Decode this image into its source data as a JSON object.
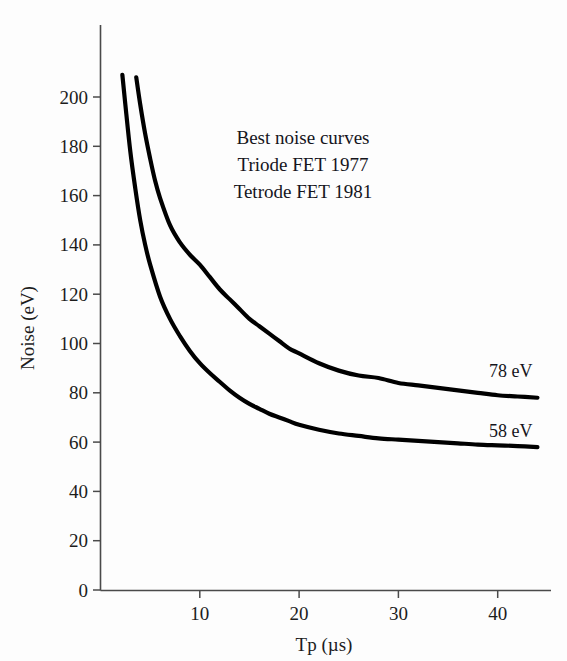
{
  "figure": {
    "background_color": "#fdfdfd",
    "curve_color": "#000000",
    "axis_color": "#4a4a4a",
    "text_color": "#15151c"
  },
  "annotations": {
    "line1": "Best noise curves",
    "line2": "Triode FET 1977",
    "line3": "Tetrode FET 1981"
  },
  "curve_labels": {
    "upper": "78 eV",
    "lower": "58 eV"
  },
  "axis_titles": {
    "x": "Tp (µs)",
    "y": "Noise (eV)"
  },
  "x_ticks": [
    "10",
    "20",
    "30",
    "40"
  ],
  "y_ticks": [
    "0",
    "20",
    "40",
    "60",
    "80",
    "100",
    "120",
    "140",
    "160",
    "180",
    "200"
  ],
  "chart_data": {
    "type": "line",
    "title": "Best noise curves",
    "subtitle": "Triode FET 1977 / Tetrode FET 1981",
    "xlabel": "Tp (µs)",
    "ylabel": "Noise (eV)",
    "xlim": [
      0,
      44
    ],
    "ylim": [
      0,
      215
    ],
    "xticks": [
      10,
      20,
      30,
      40
    ],
    "yticks": [
      0,
      20,
      40,
      60,
      80,
      100,
      120,
      140,
      160,
      180,
      200
    ],
    "grid": false,
    "legend": "none",
    "annotations": [
      {
        "text": "Best noise curves",
        "x": 21,
        "y": 192
      },
      {
        "text": "Triode FET 1977",
        "x": 21,
        "y": 180
      },
      {
        "text": "Tetrode FET 1981",
        "x": 21,
        "y": 168
      },
      {
        "text": "78 eV",
        "x": 41,
        "y": 89
      },
      {
        "text": "58 eV",
        "x": 41,
        "y": 68
      }
    ],
    "series": [
      {
        "name": "Triode FET 1977",
        "asymptote_eV": 78,
        "label": "78 eV",
        "x": [
          3.6,
          4.0,
          4.5,
          5.0,
          5.5,
          6.0,
          7.0,
          8.0,
          9.0,
          10.0,
          11.0,
          12.0,
          13.0,
          14.0,
          15.0,
          16.0,
          17.0,
          18.0,
          19.0,
          20.0,
          22.0,
          24.0,
          26.0,
          28.0,
          30.0,
          32.0,
          34.0,
          36.0,
          38.0,
          40.0,
          42.0,
          44.0
        ],
        "y": [
          208,
          197,
          185,
          175,
          166,
          159,
          148,
          141,
          136,
          132,
          127,
          122,
          118,
          114,
          110,
          107,
          104,
          101,
          98,
          96,
          92,
          89,
          87,
          86,
          84,
          83,
          82,
          81,
          80,
          79,
          78.5,
          78
        ]
      },
      {
        "name": "Tetrode FET 1981",
        "asymptote_eV": 58,
        "label": "58 eV",
        "x": [
          2.2,
          2.5,
          3.0,
          3.5,
          4.0,
          4.5,
          5.0,
          6.0,
          7.0,
          8.0,
          9.0,
          10.0,
          11.0,
          12.0,
          13.0,
          14.0,
          15.0,
          16.0,
          17.0,
          18.0,
          19.0,
          20.0,
          22.0,
          24.0,
          26.0,
          28.0,
          30.0,
          32.0,
          34.0,
          36.0,
          38.0,
          40.0,
          42.0,
          44.0
        ],
        "y": [
          209,
          197,
          178,
          163,
          150,
          140,
          132,
          119,
          110,
          103,
          97,
          92,
          88,
          84.5,
          81,
          78,
          75.5,
          73.5,
          71.5,
          70,
          68.5,
          67,
          65,
          63.5,
          62.5,
          61.5,
          61,
          60.5,
          60,
          59.5,
          59,
          58.7,
          58.4,
          58
        ]
      }
    ]
  },
  "geometry": {
    "x0_px": 100.5,
    "y0_px": 590,
    "px_per_x": 9.93,
    "px_per_y": 2.465,
    "plot_right_px": 547,
    "plot_top_px": 25
  }
}
